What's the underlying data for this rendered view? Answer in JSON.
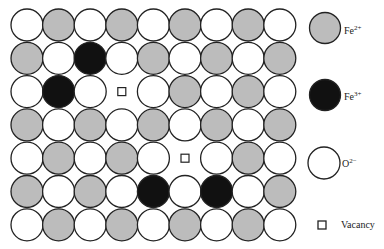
{
  "diagram": {
    "colors": {
      "fe2": "#bcbcbc",
      "fe3": "#111111",
      "o2": "#ffffff",
      "stroke": "#222222",
      "background": "#ffffff"
    },
    "grid": {
      "rows": 7,
      "cols": 9,
      "legend_key": "W = O2- (white), G = Fe2+ (grey), B = Fe3+ (black), V = Vacancy",
      "cells": [
        [
          "W",
          "G",
          "W",
          "G",
          "W",
          "G",
          "W",
          "G",
          "W"
        ],
        [
          "G",
          "W",
          "B",
          "W",
          "G",
          "W",
          "G",
          "W",
          "G"
        ],
        [
          "W",
          "B",
          "W",
          "V",
          "W",
          "G",
          "W",
          "G",
          "W"
        ],
        [
          "G",
          "W",
          "G",
          "W",
          "G",
          "W",
          "G",
          "W",
          "G"
        ],
        [
          "W",
          "G",
          "W",
          "G",
          "W",
          "V",
          "W",
          "G",
          "W"
        ],
        [
          "G",
          "W",
          "G",
          "W",
          "B",
          "W",
          "B",
          "W",
          "G"
        ],
        [
          "W",
          "G",
          "W",
          "G",
          "W",
          "G",
          "W",
          "G",
          "W"
        ]
      ]
    }
  },
  "legend": {
    "items": [
      {
        "key": "fe2",
        "base": "Fe",
        "charge": "2+"
      },
      {
        "key": "fe3",
        "base": "Fe",
        "charge": "3+"
      },
      {
        "key": "o2",
        "base": "O",
        "charge": "2−"
      },
      {
        "key": "vacancy",
        "label": "Vacancy"
      }
    ]
  }
}
